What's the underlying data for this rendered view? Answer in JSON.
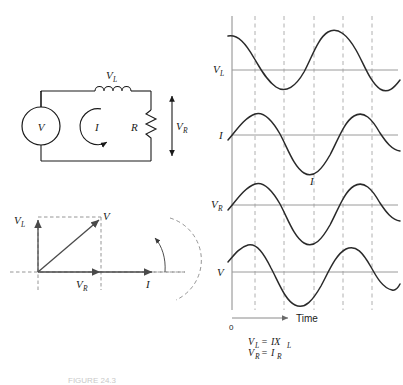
{
  "figure": {
    "caption": "FIGURE 24.3"
  },
  "circuit": {
    "source_label": "V",
    "inductor_label": "V",
    "inductor_sub": "L",
    "current_label": "I",
    "resistor_label": "R",
    "resistor_voltage_label": "V",
    "resistor_voltage_sub": "R",
    "icons": {
      "source": "ac-source-icon",
      "inductor": "inductor-coil-icon",
      "resistor": "resistor-zigzag-icon",
      "current_loop": "current-loop-arrow-icon",
      "voltage_arrow": "voltage-double-arrow-icon"
    }
  },
  "phasor": {
    "vl_label": "V",
    "vl_sub": "L",
    "v_label": "V",
    "vr_label": "V",
    "vr_sub": "R",
    "i_label": "I",
    "rotation_icon": "rotation-arrow-icon"
  },
  "waveforms": {
    "axis_x_label": "Time",
    "axis_origin_label": "0",
    "traces": [
      {
        "name": "vl-trace",
        "label": "V",
        "sub": "L",
        "phase_deg": 90,
        "inline_label": ""
      },
      {
        "name": "i-trace",
        "label": "I",
        "sub": "",
        "phase_deg": 0,
        "inline_label": "I"
      },
      {
        "name": "vr-trace",
        "label": "V",
        "sub": "R",
        "phase_deg": 0,
        "inline_label": ""
      },
      {
        "name": "v-trace",
        "label": "V",
        "sub": "",
        "phase_deg": 45,
        "inline_label": ""
      }
    ],
    "gridline_count": 5
  },
  "equations": {
    "line1_lhs": "V",
    "line1_lhs_sub": "L",
    "line1_eq": "=",
    "line1_rhs": "IX",
    "line1_rhs_sub": "L",
    "line2_lhs": "V",
    "line2_lhs_sub": "R",
    "line2_eq": "=",
    "line2_rhs": "I",
    "line2_rhs_sub": "R"
  },
  "colors": {
    "ink": "#1a1a1a",
    "curve": "#2a2a2a",
    "grid": "#b0b0b0",
    "baseline": "#9a9a9a",
    "phasor": "#4a4a4a",
    "background": "#ffffff"
  }
}
